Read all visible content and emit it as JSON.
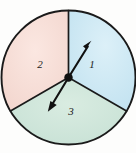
{
  "figure": {
    "name": "probability-spinner",
    "background_color": "#fdfdfc",
    "outline_color": "#1a1a1a"
  },
  "spinner": {
    "center": {
      "x": 68.5,
      "y": 77.5
    },
    "radius": 67,
    "sectors": [
      {
        "label": "1",
        "color": "#cbe7f2",
        "start_angle_deg": 90,
        "end_angle_deg": -30,
        "label_x": 92,
        "label_y": 65
      },
      {
        "label": "2",
        "color": "#f6ddd6",
        "start_angle_deg": 210,
        "end_angle_deg": 90,
        "label_x": 40,
        "label_y": 65
      },
      {
        "label": "3",
        "color": "#cfe6da",
        "start_angle_deg": -30,
        "end_angle_deg": -150,
        "label_x": 71,
        "label_y": 112
      }
    ],
    "pointers": [
      {
        "name": "upper-pointer",
        "direction_deg": 67,
        "length": 41,
        "color": "#111111",
        "points_to_sector": "1"
      },
      {
        "name": "lower-pointer",
        "direction_deg": 238,
        "length": 36,
        "color": "#111111",
        "points_to_sector": "3"
      }
    ],
    "hub": {
      "name": "center-hub",
      "radius": 4.2,
      "color": "#111111"
    }
  }
}
